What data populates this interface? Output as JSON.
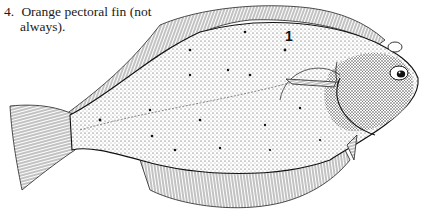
{
  "caption": {
    "number": "4.",
    "line1": "Orange pectoral fin (not",
    "line2": "always)."
  },
  "figure": {
    "callout_label": "1",
    "ink_color": "#1a1a1a",
    "background": "#ffffff"
  }
}
